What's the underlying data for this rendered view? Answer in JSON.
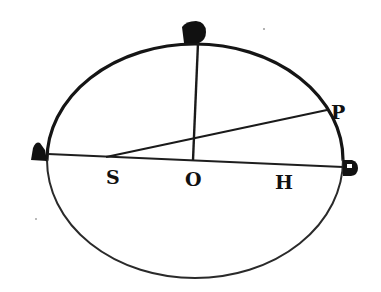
{
  "figure": {
    "type": "ellipse-orbit-diagram",
    "stroke_color": "#1a1a1a",
    "background": "#ffffff"
  },
  "ellipse": {
    "cx": 195,
    "cy": 160,
    "rx": 148,
    "ry": 116
  },
  "points": {
    "A": {
      "x": 48,
      "y": 154
    },
    "B_top": {
      "x": 198,
      "y": 43
    },
    "B_right": {
      "x": 343,
      "y": 167
    },
    "P": {
      "x": 327,
      "y": 110
    },
    "S": {
      "x": 115,
      "y": 157
    },
    "O": {
      "x": 193,
      "y": 160
    },
    "H": {
      "x": 288,
      "y": 164
    }
  },
  "labels": {
    "left_vertex": "A",
    "top_vertex": "B",
    "right_vertex": "B",
    "point_p": "P",
    "focus_s": "S",
    "center_o": "O",
    "focus_h": "H"
  },
  "segments": [
    {
      "from": "A",
      "to": "B_right",
      "name": "major-axis"
    },
    {
      "from": "O",
      "to": "B_top",
      "name": "semi-minor-axis"
    },
    {
      "from": "S",
      "to": "P",
      "name": "radius-vector-SP"
    }
  ]
}
